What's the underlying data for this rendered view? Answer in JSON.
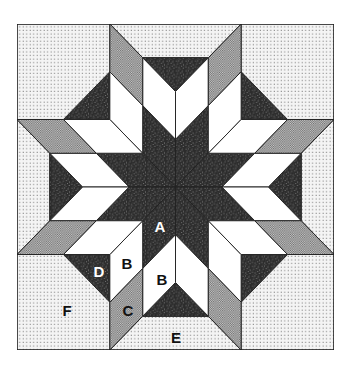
{
  "diagram": {
    "type": "quilt-block",
    "fabrics": {
      "dark_textured": "#2a2a2a",
      "white": "#ffffff",
      "medium_gray_check": "#9a9a9a",
      "light_gray_dot": "#e6e6e6",
      "outline": "#222222"
    },
    "pieces": [
      {
        "letter": "A",
        "name": "center dark diamond"
      },
      {
        "letter": "B",
        "name": "white diamond"
      },
      {
        "letter": "C",
        "name": "gray tip diamond"
      },
      {
        "letter": "D",
        "name": "dark setting triangle"
      },
      {
        "letter": "E",
        "name": "side trapezoid"
      },
      {
        "letter": "F",
        "name": "corner square"
      }
    ]
  },
  "labels": [
    {
      "text": "A",
      "x": 160,
      "y": 226,
      "tone": "on-dark"
    },
    {
      "text": "B",
      "x": 127,
      "y": 263,
      "tone": "on-light"
    },
    {
      "text": "B",
      "x": 162,
      "y": 279,
      "tone": "on-light"
    },
    {
      "text": "C",
      "x": 128,
      "y": 310,
      "tone": "on-light"
    },
    {
      "text": "D",
      "x": 99,
      "y": 271,
      "tone": "on-dark"
    },
    {
      "text": "E",
      "x": 176,
      "y": 337,
      "tone": "on-light"
    },
    {
      "text": "F",
      "x": 67,
      "y": 310,
      "tone": "on-light"
    }
  ]
}
